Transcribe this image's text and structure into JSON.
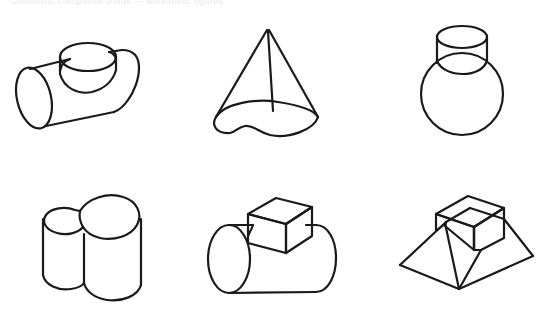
{
  "page": {
    "background_color": "#ffffff",
    "ink_color": "#1a1a1a",
    "header_faint_text": "Geometric composite solids — worksheet figures",
    "layout": {
      "columns": 3,
      "rows": 2,
      "total_figures": 6
    }
  },
  "figures": [
    {
      "id": "figure-1",
      "position": "row-1-col-1",
      "name": "horizontal-cylinder-with-vertical-cylinder",
      "label": "Horizontal cylinder with smaller vertical cylinder on top",
      "parts": [
        "horizontal cylinder",
        "vertical cylinder"
      ],
      "stroke_width": 2.2
    },
    {
      "id": "figure-2",
      "position": "row-1-col-2",
      "name": "cone-on-irregular-base",
      "label": "Cone with irregular elliptical base",
      "parts": [
        "cone",
        "irregular base disc"
      ],
      "stroke_width": 2.2
    },
    {
      "id": "figure-3",
      "position": "row-1-col-3",
      "name": "sphere-with-cylindrical-neck",
      "label": "Sphere topped by a cylindrical neck",
      "parts": [
        "sphere",
        "cylinder neck"
      ],
      "stroke_width": 2.2
    },
    {
      "id": "figure-4",
      "position": "row-2-col-1",
      "name": "two-fused-vertical-cylinders",
      "label": "Two overlapping vertical cylinders fused together",
      "parts": [
        "large cylinder",
        "small cylinder"
      ],
      "stroke_width": 2.2
    },
    {
      "id": "figure-5",
      "position": "row-2-col-2",
      "name": "horizontal-cylinder-with-cube",
      "label": "Horizontal cylinder with a cube on top",
      "parts": [
        "horizontal cylinder",
        "cube"
      ],
      "stroke_width": 2.2
    },
    {
      "id": "figure-6",
      "position": "row-2-col-3",
      "name": "cube-on-truncated-pyramid",
      "label": "Cube resting on a truncated pyramid",
      "parts": [
        "cube",
        "truncated pyramid"
      ],
      "stroke_width": 2.2
    }
  ]
}
